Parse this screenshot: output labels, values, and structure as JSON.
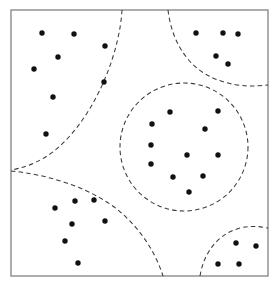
{
  "figure": {
    "type": "scatter",
    "width": 278,
    "height": 286,
    "background_color": "#ffffff",
    "frame": {
      "x": 11,
      "y": 10,
      "width": 257,
      "height": 266,
      "stroke_color": "#8a8a8a",
      "stroke_width": 1.4
    },
    "point_style": {
      "color": "#111111",
      "radius": 2.7,
      "shape": "filled-circle"
    },
    "boundary_style": {
      "color": "#3a3a3a",
      "stroke_width": 1.05,
      "dash_pattern": "4.5 3.2",
      "fill": "none"
    }
  },
  "chart_data": {
    "type": "scatter",
    "subtitle": "",
    "xlabel": "",
    "ylabel": "",
    "xlim": [
      11,
      268
    ],
    "ylim": [
      10,
      276
    ],
    "grid": false,
    "legend": "none",
    "axis_ticks": false,
    "annotations": [],
    "cluster_count": 5,
    "point_count": 35,
    "series": [
      {
        "name": "top-left-cluster",
        "color": "#111111",
        "count": 8,
        "points": [
          {
            "x": 42,
            "y": 33
          },
          {
            "x": 74,
            "y": 34
          },
          {
            "x": 105,
            "y": 46
          },
          {
            "x": 58,
            "y": 57
          },
          {
            "x": 34,
            "y": 69
          },
          {
            "x": 104,
            "y": 82
          },
          {
            "x": 53,
            "y": 97
          },
          {
            "x": 46,
            "y": 134
          }
        ]
      },
      {
        "name": "top-right-cluster",
        "color": "#111111",
        "count": 5,
        "points": [
          {
            "x": 196,
            "y": 33
          },
          {
            "x": 223,
            "y": 33
          },
          {
            "x": 238,
            "y": 34
          },
          {
            "x": 216,
            "y": 56
          },
          {
            "x": 228,
            "y": 64
          }
        ]
      },
      {
        "name": "center-cluster",
        "color": "#111111",
        "count": 11,
        "points": [
          {
            "x": 170,
            "y": 112
          },
          {
            "x": 218,
            "y": 111
          },
          {
            "x": 152,
            "y": 124
          },
          {
            "x": 205,
            "y": 129
          },
          {
            "x": 151,
            "y": 145
          },
          {
            "x": 187,
            "y": 155
          },
          {
            "x": 218,
            "y": 155
          },
          {
            "x": 151,
            "y": 164
          },
          {
            "x": 173,
            "y": 177
          },
          {
            "x": 203,
            "y": 176
          },
          {
            "x": 189,
            "y": 192
          }
        ]
      },
      {
        "name": "bottom-left-cluster",
        "color": "#111111",
        "count": 7,
        "points": [
          {
            "x": 55,
            "y": 208
          },
          {
            "x": 75,
            "y": 201
          },
          {
            "x": 94,
            "y": 200
          },
          {
            "x": 72,
            "y": 224
          },
          {
            "x": 105,
            "y": 221
          },
          {
            "x": 65,
            "y": 241
          },
          {
            "x": 78,
            "y": 263
          }
        ]
      },
      {
        "name": "bottom-right-cluster",
        "color": "#111111",
        "count": 4,
        "points": [
          {
            "x": 236,
            "y": 243
          },
          {
            "x": 256,
            "y": 246
          },
          {
            "x": 218,
            "y": 264
          },
          {
            "x": 239,
            "y": 264
          }
        ]
      }
    ],
    "boundaries": [
      {
        "name": "center-circle-boundary",
        "shape": "circle",
        "cx": 184,
        "cy": 147,
        "r": 64
      },
      {
        "name": "top-left-boundary",
        "shape": "curve",
        "path": "M 122 10 C 120 48, 100 105, 66 140 C 52 155, 34 166, 11 170"
      },
      {
        "name": "top-right-boundary",
        "shape": "curve",
        "path": "M 168 10 C 172 44, 190 70, 218 80 C 240 88, 256 86, 268 85"
      },
      {
        "name": "bottom-left-boundary",
        "shape": "curve",
        "path": "M 11 171 C 44 174, 88 186, 118 210 C 142 230, 156 254, 163 276"
      },
      {
        "name": "bottom-right-boundary",
        "shape": "curve",
        "path": "M 200 276 C 204 252, 218 234, 240 228 C 253 225, 262 227, 268 228"
      }
    ]
  }
}
